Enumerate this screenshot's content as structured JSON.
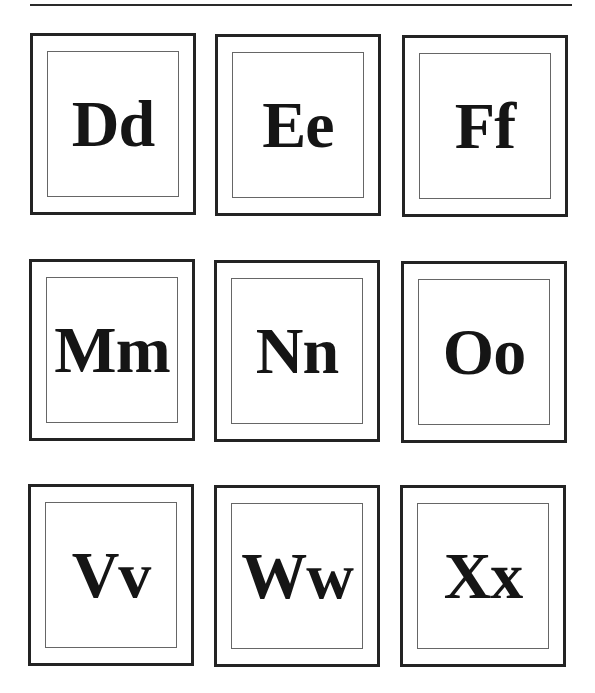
{
  "page": {
    "rule_color": "#2a2a2a",
    "cards": [
      {
        "label": "Dd",
        "x": 30,
        "y": 33
      },
      {
        "label": "Ee",
        "x": 215,
        "y": 34
      },
      {
        "label": "Ff",
        "x": 402,
        "y": 35
      },
      {
        "label": "Mm",
        "x": 29,
        "y": 259
      },
      {
        "label": "Nn",
        "x": 214,
        "y": 260
      },
      {
        "label": "Oo",
        "x": 401,
        "y": 261
      },
      {
        "label": "Vv",
        "x": 28,
        "y": 484
      },
      {
        "label": "Ww",
        "x": 214,
        "y": 485
      },
      {
        "label": "Xx",
        "x": 400,
        "y": 485
      }
    ]
  }
}
